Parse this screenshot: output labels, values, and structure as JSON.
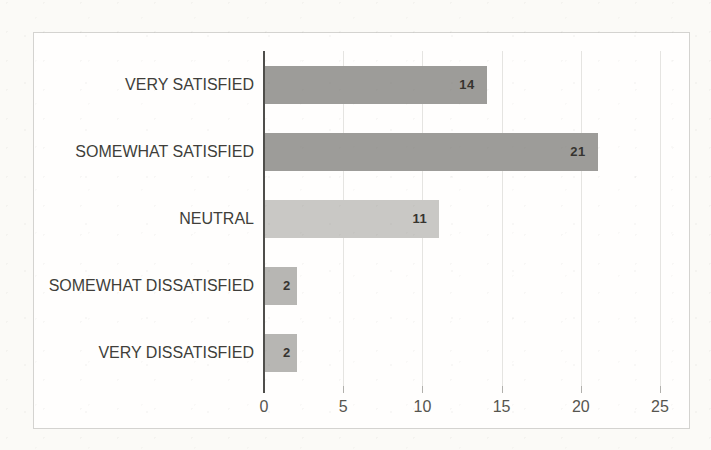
{
  "chart_data": {
    "type": "bar",
    "orientation": "horizontal",
    "title": "",
    "categories": [
      "VERY SATISFIED",
      "SOMEWHAT SATISFIED",
      "NEUTRAL",
      "SOMEWHAT DISSATISFIED",
      "VERY DISSATISFIED"
    ],
    "values": [
      14,
      21,
      11,
      2,
      2
    ],
    "data_labels": [
      "14",
      "21",
      "11",
      "2",
      "2"
    ],
    "bar_colors": [
      "#9d9c99",
      "#9d9c99",
      "#c9c8c5",
      "#b7b6b3",
      "#b7b6b3"
    ],
    "x_ticks": [
      0,
      5,
      10,
      15,
      20,
      25
    ],
    "xlim": [
      0,
      26.5
    ],
    "xlabel": "",
    "ylabel": "",
    "grid": true,
    "legend": "none",
    "data_label_position": "inside-end",
    "colors": {
      "axis_line": "#4f4e4b",
      "gridline": "#e5e4e1",
      "tick_mark": "#b1b0ac",
      "tick_label": "#56554f",
      "category_label": "#403e3a",
      "data_label": "#363430",
      "chart_border": "#d4d3d0",
      "chart_background": "#fffefd",
      "page_background": "#fbfaf7"
    }
  }
}
